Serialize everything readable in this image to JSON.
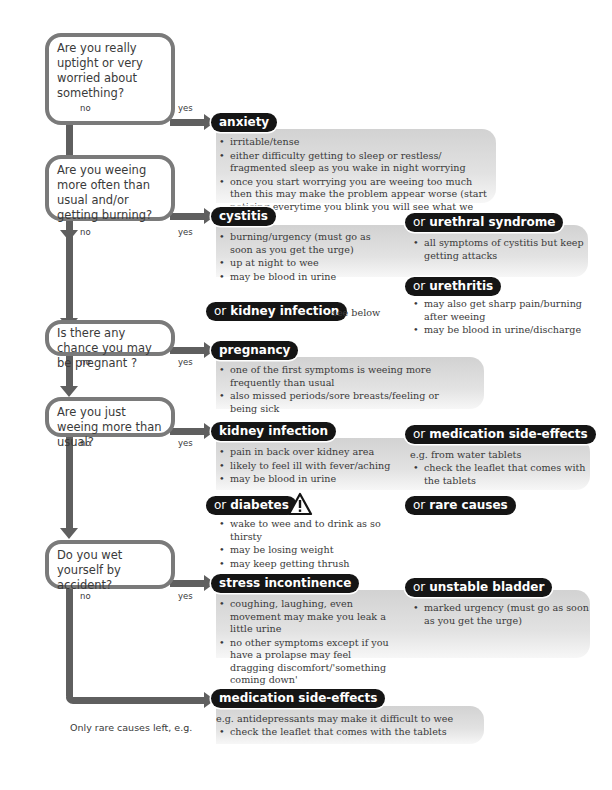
{
  "questions": [
    {
      "text": "Are you really uptight or very worried about something?",
      "no": "no",
      "yes": "yes"
    },
    {
      "text": "Are you weeing more often than usual and/or getting burning?",
      "no": "no",
      "yes": "yes"
    },
    {
      "text": "Is there any chance you may be pregnant ?",
      "no": "no",
      "yes": "yes"
    },
    {
      "text": "Are you just weeing more than usual?",
      "no": "no",
      "yes": "yes"
    },
    {
      "text": "Do you wet yourself by accident?",
      "no": "no",
      "yes": "yes"
    }
  ],
  "or_prefix": "or",
  "outcomes": {
    "anxiety": {
      "label": "anxiety",
      "bullets": [
        "irritable/tense",
        "either difficulty getting to sleep or restless/ fragmented sleep as you wake in night worrying",
        "once you start worrying you are weeing too much then this may make the problem appear worse (start noticing everytime you blink you will see what we mean)"
      ]
    },
    "cystitis": {
      "label": "cystitis",
      "bullets": [
        "burning/urgency (must go as soon as you get the urge)",
        "up at night to wee",
        "may be blood in urine"
      ]
    },
    "urethral_syndrome": {
      "label": "urethral syndrome",
      "bullets": [
        "all symptoms of cystitis but keep getting attacks"
      ]
    },
    "urethritis": {
      "label": "urethritis",
      "bullets": [
        "may also get sharp pain/burning after weeing",
        "may be blood in urine/discharge"
      ]
    },
    "kidney_infection_ref": {
      "label": "kidney infection",
      "note": "see below"
    },
    "pregnancy": {
      "label": "pregnancy",
      "bullets": [
        "one of the first symptoms is weeing more frequently than usual",
        "also missed periods/sore breasts/feeling or being sick"
      ]
    },
    "kidney_infection": {
      "label": "kidney infection",
      "bullets": [
        "pain in back over kidney area",
        "likely to feel ill with fever/aching",
        "may be blood in urine"
      ]
    },
    "medication_side_effects_1": {
      "label": "medication side-effects",
      "intro": "e.g. from water tablets",
      "bullets": [
        "check the leaflet that comes with the tablets"
      ]
    },
    "diabetes": {
      "label": "diabetes",
      "icon": "warning-triangle-icon",
      "bullets": [
        "wake to wee and to drink as so thirsty",
        "may be losing weight",
        "may keep getting thrush"
      ]
    },
    "rare_causes": {
      "label": "rare causes"
    },
    "stress_incontinence": {
      "label": "stress incontinence",
      "bullets": [
        "coughing, laughing, even movement may make you leak a little urine",
        "no other symptoms except if you have a prolapse may feel dragging discomfort/'something coming down'"
      ]
    },
    "unstable_bladder": {
      "label": "unstable bladder",
      "bullets": [
        "marked urgency (must go as soon as you get the urge)"
      ]
    },
    "medication_side_effects_2": {
      "label": "medication side-effects",
      "intro": "e.g. antidepressants may make it difficult to wee",
      "bullets": [
        "check the leaflet that comes with the tablets"
      ]
    }
  },
  "final_note": "Only rare causes left, e.g.",
  "colors": {
    "connector": "#5f5f5f",
    "pill": "#151515",
    "panel": "#d8d8d8",
    "box_border": "#7a7a7a",
    "text": "#3a3a3a"
  }
}
